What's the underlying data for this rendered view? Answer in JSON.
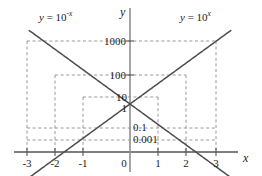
{
  "figure": {
    "kind": "math-graph",
    "background_color": "#ffffff",
    "axis_color": "#555555",
    "curve_color": "#4d4d4d",
    "grid_color": "#8c8c8c"
  },
  "axes": {
    "x_axis_label": "x",
    "y_axis_label": "y",
    "x_ticks": [
      "-3",
      "-2",
      "-1",
      "0",
      "1",
      "2",
      "3"
    ],
    "y_value_labels": [
      "1000",
      "100",
      "10",
      "1",
      "0.1",
      "0.001"
    ]
  },
  "curve_labels": {
    "left": {
      "lhs": "y",
      "eq": " = ",
      "base": "10",
      "exp": "-x"
    },
    "right": {
      "lhs": "y",
      "eq": " = ",
      "base": "10",
      "exp": "x"
    }
  },
  "chart_data": {
    "type": "line",
    "title": "",
    "xlabel": "x",
    "ylabel": "y",
    "xlim": [
      -3.4,
      3.4
    ],
    "ylim_log10": [
      -3,
      3
    ],
    "y_scale": "log",
    "grid": true,
    "legend_position": "inline-curve-labels",
    "x_tick_values": [
      -3,
      -2,
      -1,
      0,
      1,
      2,
      3
    ],
    "x_tick_labels": [
      "-3",
      "-2",
      "-1",
      "0",
      "1",
      "2",
      "3"
    ],
    "y_tick_values": [
      1000,
      100,
      10,
      1,
      0.1,
      0.001
    ],
    "y_tick_labels": [
      "1000",
      "100",
      "10",
      "1",
      "0.1",
      "0.001"
    ],
    "series": [
      {
        "name": "y = 10^x",
        "label_text": "y = 10^x",
        "x": [
          -3,
          -2,
          -1,
          0,
          1,
          2,
          3
        ],
        "values": [
          0.001,
          0.01,
          0.1,
          1,
          10,
          100,
          1000
        ]
      },
      {
        "name": "y = 10^-x",
        "label_text": "y = 10^-x",
        "x": [
          -3,
          -2,
          -1,
          0,
          1,
          2,
          3
        ],
        "values": [
          1000,
          100,
          10,
          1,
          0.1,
          0.01,
          0.001
        ]
      }
    ],
    "annotations": [
      {
        "text": "y = 10^-x",
        "x": -2.6,
        "y_log10": 3.4
      },
      {
        "text": "y = 10^x",
        "x": 2.1,
        "y_log10": 3.4
      }
    ],
    "gridlines_dashed_horizontal": [
      1000,
      100,
      10,
      0.1,
      0.001
    ],
    "gridlines_dashed_vertical": [
      -3,
      -2,
      -1,
      1,
      2,
      3
    ]
  }
}
